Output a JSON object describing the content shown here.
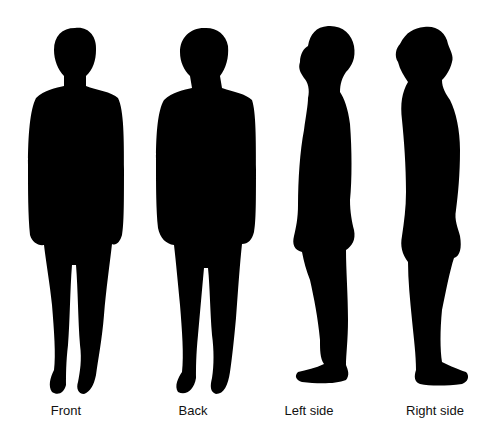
{
  "colors": {
    "background": "#ffffff",
    "silhouette": "#000000",
    "label": "#111111"
  },
  "views": [
    {
      "id": "front",
      "label": "Front"
    },
    {
      "id": "back",
      "label": "Back"
    },
    {
      "id": "left",
      "label": "Left side"
    },
    {
      "id": "right",
      "label": "Right side"
    }
  ]
}
